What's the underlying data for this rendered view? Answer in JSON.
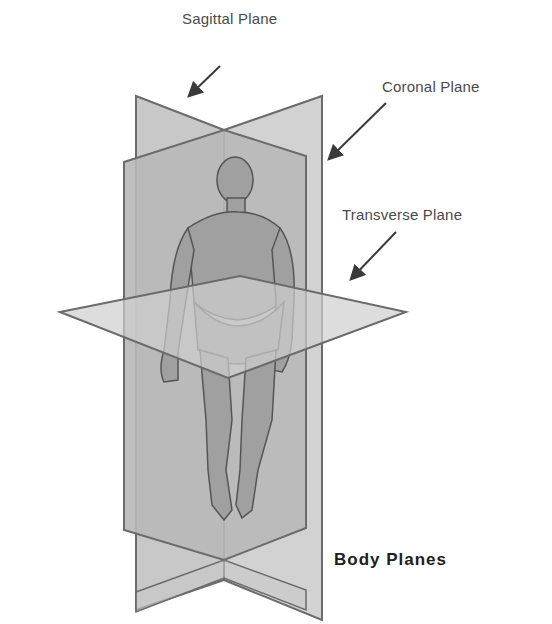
{
  "diagram": {
    "title": "Body Planes",
    "labels": {
      "sagittal": "Sagittal Plane",
      "coronal": "Coronal Plane",
      "transverse": "Transverse Plane"
    },
    "colors": {
      "plane_fill": "#c4c4c4",
      "plane_edge": "#6b6b6b",
      "figure_fill": "#9a9a9a",
      "figure_edge": "#555555",
      "arrow": "#3a3a3a",
      "label_text": "#4a4a4a",
      "caption_text": "#1e1e1e"
    }
  }
}
